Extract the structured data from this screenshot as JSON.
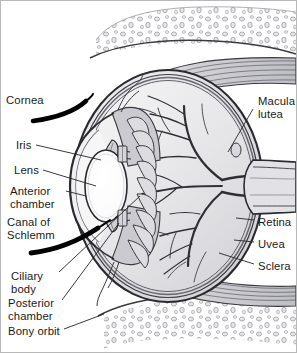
{
  "figure": {
    "type": "anatomical-diagram",
    "background_color": "#ffffff",
    "frame_color": "#b8b8b8",
    "ink_color": "#262626",
    "labels_left": [
      {
        "id": "cornea",
        "text": "Cornea",
        "x": 6,
        "y": 94,
        "lines": [
          "Cornea"
        ]
      },
      {
        "id": "iris",
        "text": "Iris",
        "x": 16,
        "y": 139,
        "lines": [
          "Iris"
        ]
      },
      {
        "id": "lens",
        "text": "Lens",
        "x": 14,
        "y": 164,
        "lines": [
          "Lens"
        ]
      },
      {
        "id": "anterior-chamber",
        "text": "Anterior chamber",
        "x": 10,
        "y": 185,
        "lines": [
          "Anterior",
          "chamber"
        ]
      },
      {
        "id": "canal-of-schlemm",
        "text": "Canal of Schlemm",
        "x": 7,
        "y": 216,
        "lines": [
          "Canal of",
          "Schlemm"
        ]
      },
      {
        "id": "ciliary-body",
        "text": "Ciliary body",
        "x": 11,
        "y": 270,
        "lines": [
          "Ciliary",
          "body"
        ]
      },
      {
        "id": "posterior-chamber",
        "text": "Posterior chamber",
        "x": 8,
        "y": 297,
        "lines": [
          "Posterior",
          "chamber"
        ]
      },
      {
        "id": "bony-orbit",
        "text": "Bony orbit",
        "x": 8,
        "y": 325,
        "lines": [
          "Bony orbit"
        ]
      }
    ],
    "labels_right": [
      {
        "id": "macula-lutea",
        "text": "Macula lutea",
        "x": 258,
        "y": 95,
        "lines": [
          "Macula",
          "lutea"
        ]
      },
      {
        "id": "retina",
        "text": "Retina",
        "x": 258,
        "y": 216,
        "lines": [
          "Retina"
        ]
      },
      {
        "id": "uvea",
        "text": "Uvea",
        "x": 258,
        "y": 238,
        "lines": [
          "Uvea"
        ]
      },
      {
        "id": "sclera",
        "text": "Sclera",
        "x": 258,
        "y": 260,
        "lines": [
          "Sclera"
        ]
      }
    ],
    "structures": [
      {
        "id": "orbital-fat-superior",
        "name": "orbital adipose tissue (superior)"
      },
      {
        "id": "orbital-fat-inferior",
        "name": "orbital adipose tissue (inferior)"
      },
      {
        "id": "extraocular-muscle-superior",
        "name": "superior rectus muscle"
      },
      {
        "id": "extraocular-muscle-inferior",
        "name": "inferior rectus muscle"
      },
      {
        "id": "globe",
        "name": "eyeball (vitreous body)"
      },
      {
        "id": "sclera-shell",
        "name": "sclera"
      },
      {
        "id": "choroid",
        "name": "choroid / uvea"
      },
      {
        "id": "retina-layer",
        "name": "retina"
      },
      {
        "id": "cornea-arc",
        "name": "cornea"
      },
      {
        "id": "iris-body",
        "name": "iris"
      },
      {
        "id": "lens-body",
        "name": "lens"
      },
      {
        "id": "ciliary-processes",
        "name": "ciliary processes"
      },
      {
        "id": "optic-nerve",
        "name": "optic nerve head"
      },
      {
        "id": "retinal-vessels",
        "name": "retinal blood vessels"
      }
    ]
  }
}
